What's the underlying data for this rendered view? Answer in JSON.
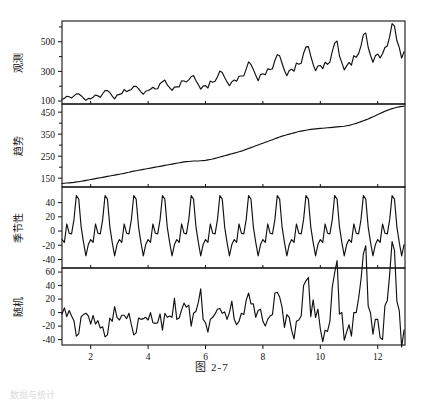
{
  "figure": {
    "caption": "图  2-7",
    "footer_faint": "数据与统计",
    "xlabel": "",
    "x_ticks": [
      2,
      4,
      6,
      8,
      10,
      12
    ],
    "x_range": [
      1,
      12.95
    ]
  },
  "chart_data": {
    "type": "line",
    "title": "图  2-7",
    "xlabel": "",
    "grid": false,
    "legend": "none",
    "x_ticks": [
      2,
      4,
      6,
      8,
      10,
      12
    ],
    "x_range": [
      1,
      12.95
    ],
    "panels": [
      {
        "name": "observed",
        "ylabel": "观测",
        "ylim": [
          80,
          640
        ],
        "y_ticks": [
          100,
          300,
          500
        ],
        "y_minor_ticks": [
          200,
          400,
          600
        ],
        "values": [
          112,
          118,
          132,
          129,
          121,
          135,
          148,
          148,
          136,
          119,
          104,
          118,
          115,
          126,
          141,
          135,
          125,
          149,
          170,
          170,
          158,
          133,
          114,
          140,
          145,
          150,
          178,
          163,
          172,
          178,
          199,
          199,
          184,
          162,
          146,
          166,
          171,
          180,
          193,
          181,
          183,
          218,
          230,
          242,
          209,
          191,
          172,
          194,
          196,
          196,
          236,
          235,
          229,
          243,
          264,
          272,
          237,
          211,
          180,
          201,
          204,
          188,
          235,
          227,
          234,
          264,
          302,
          293,
          259,
          229,
          203,
          229,
          242,
          233,
          267,
          269,
          270,
          315,
          364,
          347,
          312,
          274,
          237,
          278,
          284,
          277,
          317,
          313,
          318,
          374,
          413,
          405,
          355,
          306,
          271,
          306,
          315,
          301,
          356,
          348,
          355,
          422,
          465,
          467,
          404,
          347,
          305,
          336,
          340,
          318,
          362,
          348,
          363,
          435,
          491,
          505,
          404,
          359,
          310,
          337,
          360,
          342,
          406,
          396,
          420,
          472,
          548,
          559,
          463,
          407,
          362,
          405,
          417,
          391,
          419,
          461,
          472,
          535,
          622,
          606,
          508,
          461,
          390,
          432
        ]
      },
      {
        "name": "trend",
        "ylabel": "趋势",
        "ylim": [
          110,
          487
        ],
        "y_ticks": [
          150,
          250,
          350,
          450
        ],
        "y_minor_ticks": [
          200,
          300,
          400
        ],
        "values": [
          126,
          127,
          128,
          129,
          130,
          131,
          133,
          134,
          136,
          138,
          140,
          142,
          144,
          146,
          148,
          150,
          152,
          154,
          156,
          158,
          160,
          162,
          164,
          166,
          168,
          170,
          172,
          175,
          177,
          180,
          182,
          184,
          186,
          188,
          190,
          192,
          194,
          196,
          198,
          200,
          202,
          204,
          206,
          208,
          210,
          212,
          214,
          216,
          218,
          220,
          222,
          224,
          225,
          226,
          227,
          228,
          228,
          228,
          229,
          230,
          231,
          233,
          235,
          237,
          240,
          243,
          246,
          249,
          252,
          255,
          258,
          261,
          264,
          267,
          270,
          273,
          277,
          281,
          285,
          289,
          293,
          297,
          301,
          305,
          309,
          313,
          317,
          321,
          325,
          329,
          333,
          337,
          341,
          344,
          347,
          350,
          353,
          356,
          359,
          362,
          364,
          366,
          368,
          370,
          372,
          373,
          374,
          375,
          376,
          377,
          378,
          379,
          380,
          381,
          382,
          383,
          384,
          385,
          386,
          388,
          390,
          393,
          396,
          399,
          403,
          407,
          411,
          415,
          419,
          424,
          429,
          434,
          439,
          444,
          449,
          454,
          458,
          462,
          466,
          469,
          472,
          474,
          476,
          477
        ]
      },
      {
        "name": "seasonal",
        "ylabel": "季节性",
        "ylim": [
          -52,
          62
        ],
        "y_ticks": [
          40,
          20,
          0,
          -20,
          -40
        ],
        "y_minor_ticks": [],
        "values": [
          -12,
          -16,
          10,
          -3,
          -4,
          16,
          50,
          45,
          6,
          -16,
          -35,
          -19,
          -12,
          -16,
          10,
          -3,
          -4,
          16,
          50,
          45,
          6,
          -16,
          -35,
          -19,
          -12,
          -16,
          10,
          -3,
          -4,
          16,
          50,
          45,
          6,
          -16,
          -35,
          -19,
          -12,
          -16,
          10,
          -3,
          -4,
          16,
          50,
          45,
          6,
          -16,
          -35,
          -19,
          -12,
          -16,
          10,
          -3,
          -4,
          16,
          50,
          45,
          6,
          -16,
          -35,
          -19,
          -12,
          -16,
          10,
          -3,
          -4,
          16,
          50,
          45,
          6,
          -16,
          -35,
          -19,
          -12,
          -16,
          10,
          -3,
          -4,
          16,
          50,
          45,
          6,
          -16,
          -35,
          -19,
          -12,
          -16,
          10,
          -3,
          -4,
          16,
          50,
          45,
          6,
          -16,
          -35,
          -19,
          -12,
          -16,
          10,
          -3,
          -4,
          16,
          50,
          45,
          6,
          -16,
          -35,
          -19,
          -12,
          -16,
          10,
          -3,
          -4,
          16,
          50,
          45,
          6,
          -16,
          -35,
          -19,
          -12,
          -16,
          10,
          -3,
          -4,
          16,
          50,
          45,
          6,
          -16,
          -35,
          -19,
          -12,
          -16,
          10,
          -3,
          -4,
          16,
          50,
          45,
          6,
          -16,
          -35,
          -19
        ]
      },
      {
        "name": "random",
        "ylabel": "随机",
        "ylim": [
          -48,
          66
        ],
        "y_ticks": [
          60,
          40,
          20,
          0,
          -20,
          -40
        ],
        "y_minor_ticks": [],
        "values": [
          -2,
          7,
          -6,
          3,
          -5,
          -12,
          -35,
          -31,
          -6,
          -3,
          -1,
          -5,
          -17,
          -4,
          -17,
          -12,
          -23,
          -21,
          -36,
          -33,
          -8,
          -13,
          9,
          -7,
          -11,
          -4,
          -4,
          -9,
          -1,
          -18,
          -33,
          -30,
          -8,
          -10,
          -9,
          -7,
          -11,
          0,
          -15,
          -16,
          -15,
          -2,
          -26,
          -1,
          -7,
          -5,
          -7,
          21,
          -10,
          -8,
          4,
          14,
          8,
          11,
          -20,
          -1,
          2,
          15,
          35,
          -10,
          -15,
          -29,
          -10,
          -7,
          -2,
          5,
          6,
          -1,
          1,
          -10,
          0,
          17,
          -10,
          -18,
          -13,
          -1,
          -3,
          18,
          29,
          13,
          13,
          -7,
          3,
          5,
          -13,
          -20,
          -10,
          -5,
          -3,
          29,
          30,
          23,
          8,
          -22,
          -3,
          -7,
          -26,
          -39,
          -13,
          -11,
          -5,
          40,
          47,
          52,
          -6,
          19,
          -7,
          5,
          -24,
          -43,
          -26,
          -28,
          -13,
          38,
          59,
          77,
          -2,
          0,
          -41,
          -29,
          -18,
          -35,
          0,
          0,
          21,
          49,
          87,
          99,
          10,
          -1,
          -32,
          -10,
          -10,
          -37,
          -40,
          10,
          18,
          57,
          105,
          92,
          17,
          3,
          -51,
          -26
        ]
      }
    ]
  },
  "panel_labels": {
    "observed": "观测",
    "trend": "趋势",
    "seasonal": "季节性",
    "random": "随机"
  }
}
